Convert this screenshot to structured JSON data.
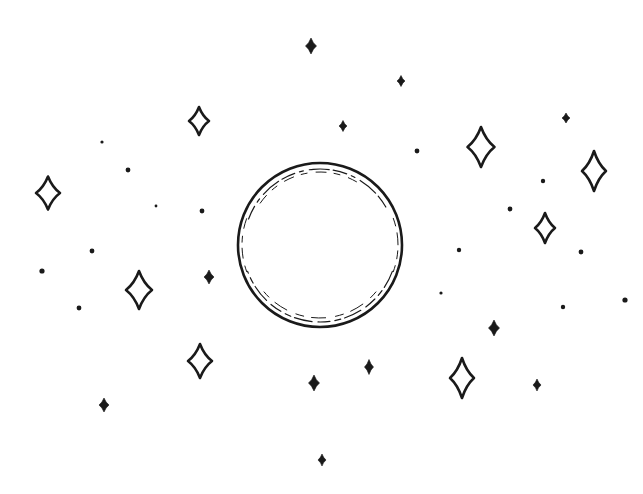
{
  "illustration": {
    "title": "Bubble among sparkles",
    "ink_color": "#1a1a1a",
    "background": "#ffffff",
    "bubble": {
      "cx": 320,
      "cy": 245,
      "r": 82
    },
    "outline_stars": [
      {
        "x": 48,
        "y": 193,
        "h": 33,
        "w": 24
      },
      {
        "x": 199,
        "y": 121,
        "h": 28,
        "w": 20
      },
      {
        "x": 139,
        "y": 290,
        "h": 38,
        "w": 26
      },
      {
        "x": 200,
        "y": 361,
        "h": 34,
        "w": 24
      },
      {
        "x": 481,
        "y": 147,
        "h": 40,
        "w": 27
      },
      {
        "x": 594,
        "y": 171,
        "h": 40,
        "w": 24
      },
      {
        "x": 545,
        "y": 228,
        "h": 30,
        "w": 20
      },
      {
        "x": 462,
        "y": 378,
        "h": 40,
        "w": 24
      }
    ],
    "solid_stars": [
      {
        "x": 311,
        "y": 46,
        "h": 16,
        "w": 11
      },
      {
        "x": 401,
        "y": 81,
        "h": 11,
        "w": 8
      },
      {
        "x": 343,
        "y": 126,
        "h": 11,
        "w": 8
      },
      {
        "x": 566,
        "y": 118,
        "h": 10,
        "w": 8
      },
      {
        "x": 209,
        "y": 277,
        "h": 14,
        "w": 10
      },
      {
        "x": 104,
        "y": 405,
        "h": 14,
        "w": 10
      },
      {
        "x": 314,
        "y": 383,
        "h": 16,
        "w": 11
      },
      {
        "x": 369,
        "y": 367,
        "h": 15,
        "w": 9
      },
      {
        "x": 322,
        "y": 460,
        "h": 12,
        "w": 8
      },
      {
        "x": 494,
        "y": 328,
        "h": 16,
        "w": 11
      },
      {
        "x": 537,
        "y": 385,
        "h": 12,
        "w": 8
      }
    ],
    "dots": [
      {
        "x": 102,
        "y": 142,
        "r": 1.6
      },
      {
        "x": 128,
        "y": 170,
        "r": 2.4
      },
      {
        "x": 156,
        "y": 206,
        "r": 1.4
      },
      {
        "x": 202,
        "y": 211,
        "r": 2.4
      },
      {
        "x": 92,
        "y": 251,
        "r": 2.4
      },
      {
        "x": 42,
        "y": 271,
        "r": 2.6
      },
      {
        "x": 79,
        "y": 308,
        "r": 2.4
      },
      {
        "x": 417,
        "y": 151,
        "r": 2.4
      },
      {
        "x": 510,
        "y": 209,
        "r": 2.4
      },
      {
        "x": 543,
        "y": 181,
        "r": 2.2
      },
      {
        "x": 459,
        "y": 250,
        "r": 2.2
      },
      {
        "x": 581,
        "y": 252,
        "r": 2.4
      },
      {
        "x": 441,
        "y": 293,
        "r": 1.6
      },
      {
        "x": 563,
        "y": 307,
        "r": 2.2
      },
      {
        "x": 625,
        "y": 300,
        "r": 2.6
      }
    ]
  }
}
